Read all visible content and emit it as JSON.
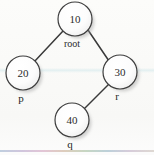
{
  "figure": {
    "kind": "binary-tree-diagram",
    "background_color": "#fdfdfc",
    "stroke_color": "#3a3a3a",
    "text_color": "#2b2b2b",
    "node_fill": "#fefefe",
    "shadow_color": "#b9b9b9"
  },
  "nodes": [
    {
      "id": "root",
      "value": "10",
      "label": "root",
      "cx": 75,
      "cy": 19,
      "r": 17,
      "label_x": 72,
      "label_y": 47
    },
    {
      "id": "left",
      "value": "20",
      "label": "p",
      "cx": 23,
      "cy": 73,
      "r": 17,
      "label_x": 21,
      "label_y": 102
    },
    {
      "id": "right",
      "value": "30",
      "label": "r",
      "cx": 120,
      "cy": 72,
      "r": 17,
      "label_x": 117,
      "label_y": 100
    },
    {
      "id": "bottom",
      "value": "40",
      "label": "q",
      "cx": 72,
      "cy": 120,
      "r": 17,
      "label_x": 70,
      "label_y": 148
    }
  ],
  "edges": [
    {
      "id": "root-to-left",
      "from": "root",
      "to": "left",
      "x1": 63,
      "y1": 31,
      "x2": 34,
      "y2": 62
    },
    {
      "id": "root-to-right",
      "from": "root",
      "to": "right",
      "x1": 88,
      "y1": 30,
      "x2": 109,
      "y2": 61
    },
    {
      "id": "right-to-bottom",
      "from": "right",
      "to": "bottom",
      "x1": 110,
      "y1": 83,
      "x2": 83,
      "y2": 110
    }
  ]
}
